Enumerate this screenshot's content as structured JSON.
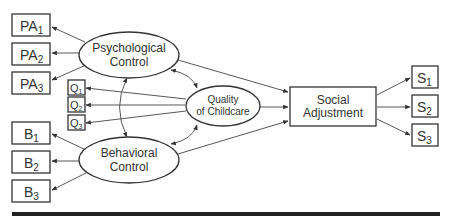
{
  "diagram": {
    "type": "structural-equation-model",
    "latent_constructs": {
      "psychological_control": {
        "line1": "Psychological",
        "line2": "Control"
      },
      "behavioral_control": {
        "line1": "Behavioral",
        "line2": "Control"
      },
      "quality_of_childcare": {
        "line1": "Quality",
        "line2": "of Childcare"
      }
    },
    "outcome": {
      "line1": "Social",
      "line2": "Adjustment"
    },
    "indicators": {
      "psychological_control": [
        {
          "base": "PA",
          "sub": "1"
        },
        {
          "base": "PA",
          "sub": "2"
        },
        {
          "base": "PA",
          "sub": "3"
        }
      ],
      "quality_of_childcare": [
        {
          "base": "Q",
          "sub": "1"
        },
        {
          "base": "Q",
          "sub": "2"
        },
        {
          "base": "Q",
          "sub": "3"
        }
      ],
      "behavioral_control": [
        {
          "base": "B",
          "sub": "1"
        },
        {
          "base": "B",
          "sub": "2"
        },
        {
          "base": "B",
          "sub": "3"
        }
      ],
      "social_adjustment": [
        {
          "base": "S",
          "sub": "1"
        },
        {
          "base": "S",
          "sub": "2"
        },
        {
          "base": "S",
          "sub": "3"
        }
      ]
    },
    "paths": [
      {
        "from": "Psychological Control",
        "to": "Social Adjustment",
        "type": "directed"
      },
      {
        "from": "Quality of Childcare",
        "to": "Social Adjustment",
        "type": "directed"
      },
      {
        "from": "Behavioral Control",
        "to": "Social Adjustment",
        "type": "directed"
      },
      {
        "from": "Psychological Control",
        "to": "Quality of Childcare",
        "type": "covariance"
      },
      {
        "from": "Psychological Control",
        "to": "Behavioral Control",
        "type": "covariance"
      },
      {
        "from": "Behavioral Control",
        "to": "Quality of Childcare",
        "type": "covariance"
      }
    ]
  }
}
